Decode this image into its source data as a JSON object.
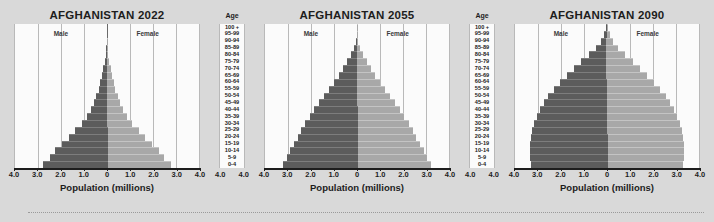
{
  "figure": {
    "background_color": "#d9d9d9",
    "plot_background_color": "#fbfbfb",
    "male_color": "#5c5c5c",
    "female_color": "#a8a8a8",
    "axis_title": "Population (millions)",
    "age_column_title": "Age",
    "male_label": "Male",
    "female_label": "Female",
    "tick_labels": [
      "4.0",
      "3.0",
      "2.0",
      "1.0",
      "0",
      "1.0",
      "2.0",
      "3.0",
      "4.0"
    ],
    "age_groups": [
      "0-4",
      "5-9",
      "10-14",
      "15-19",
      "20-24",
      "25-29",
      "30-34",
      "35-39",
      "40-44",
      "45-49",
      "50-54",
      "55-59",
      "60-64",
      "65-69",
      "70-74",
      "75-79",
      "80-84",
      "85-89",
      "90-94",
      "95-99",
      "100 +"
    ]
  },
  "chart_data": [
    {
      "type": "bar",
      "title": "AFGHANISTAN 2022",
      "xlabel": "Population (millions)",
      "ylabel": "Age",
      "xlim": [
        -4.0,
        4.0
      ],
      "grid": true,
      "legend_position": "in-plot",
      "categories": [
        "0-4",
        "5-9",
        "10-14",
        "15-19",
        "20-24",
        "25-29",
        "30-34",
        "35-39",
        "40-44",
        "45-49",
        "50-54",
        "55-59",
        "60-64",
        "65-69",
        "70-74",
        "75-79",
        "80-84",
        "85-89",
        "90-94",
        "95-99",
        "100 +"
      ],
      "series": [
        {
          "name": "Male",
          "direction": "left",
          "values": [
            2.85,
            2.55,
            2.3,
            2.0,
            1.7,
            1.4,
            1.1,
            0.88,
            0.72,
            0.58,
            0.47,
            0.37,
            0.29,
            0.22,
            0.16,
            0.1,
            0.055,
            0.025,
            0.009,
            0.003,
            0.001
          ]
        },
        {
          "name": "Female",
          "direction": "right",
          "values": [
            2.75,
            2.45,
            2.2,
            1.92,
            1.63,
            1.35,
            1.06,
            0.85,
            0.7,
            0.56,
            0.45,
            0.36,
            0.28,
            0.21,
            0.155,
            0.1,
            0.055,
            0.025,
            0.009,
            0.003,
            0.001
          ]
        }
      ]
    },
    {
      "type": "bar",
      "title": "AFGHANISTAN 2055",
      "xlabel": "Population (millions)",
      "ylabel": "Age",
      "xlim": [
        -4.0,
        4.0
      ],
      "grid": true,
      "legend_position": "in-plot",
      "categories": [
        "0-4",
        "5-9",
        "10-14",
        "15-19",
        "20-24",
        "25-29",
        "30-34",
        "35-39",
        "40-44",
        "45-49",
        "50-54",
        "55-59",
        "60-64",
        "65-69",
        "70-74",
        "75-79",
        "80-84",
        "85-89",
        "90-94",
        "95-99",
        "100 +"
      ],
      "series": [
        {
          "name": "Male",
          "direction": "left",
          "values": [
            3.25,
            3.1,
            2.95,
            2.8,
            2.62,
            2.45,
            2.28,
            2.08,
            1.88,
            1.66,
            1.45,
            1.24,
            1.02,
            0.8,
            0.6,
            0.42,
            0.26,
            0.14,
            0.06,
            0.018,
            0.004
          ]
        },
        {
          "name": "Female",
          "direction": "right",
          "values": [
            3.15,
            3.0,
            2.88,
            2.72,
            2.55,
            2.38,
            2.22,
            2.02,
            1.83,
            1.62,
            1.42,
            1.22,
            1.0,
            0.79,
            0.59,
            0.42,
            0.27,
            0.15,
            0.065,
            0.02,
            0.005
          ]
        }
      ]
    },
    {
      "type": "bar",
      "title": "AFGHANISTAN 2090",
      "xlabel": "Population (millions)",
      "ylabel": "Age",
      "xlim": [
        -4.0,
        4.0
      ],
      "grid": true,
      "legend_position": "in-plot",
      "categories": [
        "0-4",
        "5-9",
        "10-14",
        "15-19",
        "20-24",
        "25-29",
        "30-34",
        "35-39",
        "40-44",
        "45-49",
        "50-54",
        "55-59",
        "60-64",
        "65-69",
        "70-74",
        "75-79",
        "80-84",
        "85-89",
        "90-94",
        "95-99",
        "100 +"
      ],
      "series": [
        {
          "name": "Male",
          "direction": "left",
          "values": [
            3.35,
            3.38,
            3.4,
            3.38,
            3.34,
            3.28,
            3.2,
            3.08,
            2.94,
            2.76,
            2.55,
            2.3,
            2.02,
            1.72,
            1.4,
            1.08,
            0.75,
            0.46,
            0.24,
            0.1,
            0.03
          ]
        },
        {
          "name": "Female",
          "direction": "right",
          "values": [
            3.25,
            3.28,
            3.32,
            3.32,
            3.28,
            3.24,
            3.16,
            3.05,
            2.92,
            2.76,
            2.56,
            2.33,
            2.06,
            1.77,
            1.46,
            1.14,
            0.82,
            0.52,
            0.29,
            0.13,
            0.04
          ]
        }
      ]
    }
  ]
}
